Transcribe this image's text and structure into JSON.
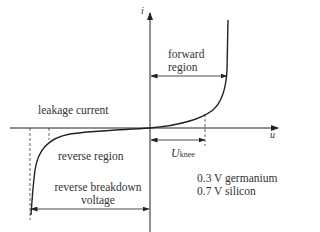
{
  "diagram": {
    "axes": {
      "y_label": "i",
      "x_label": "u"
    },
    "labels": {
      "forward_region_line1": "forward",
      "forward_region_line2": "region",
      "leakage_current": "leakage current",
      "reverse_region": "reverse region",
      "reverse_breakdown_line1": "reverse breakdown",
      "reverse_breakdown_line2": "voltage",
      "u_knee_main": "U",
      "u_knee_sub": "knee",
      "germanium": "0.3 V germanium",
      "silicon": "0.7 V silicon"
    },
    "colors": {
      "line": "#222222",
      "text": "#333333",
      "background": "#ffffff"
    }
  }
}
